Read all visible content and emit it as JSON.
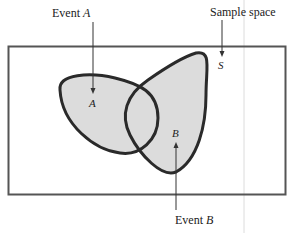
{
  "diagram": {
    "type": "venn",
    "title": "",
    "labels": {
      "event_a": {
        "prefix": "Event ",
        "var": "A"
      },
      "event_b": {
        "prefix": "Event ",
        "var": "B"
      },
      "sample_space": {
        "text": "Sample space"
      }
    },
    "region_labels": {
      "a": "A",
      "b": "B",
      "s": "S"
    },
    "colors": {
      "fill": "#dcdcdc",
      "outline": "#2a2a2a",
      "frame": "#555555",
      "arrow": "#333333",
      "guide_line": "#d8d8d8"
    }
  }
}
